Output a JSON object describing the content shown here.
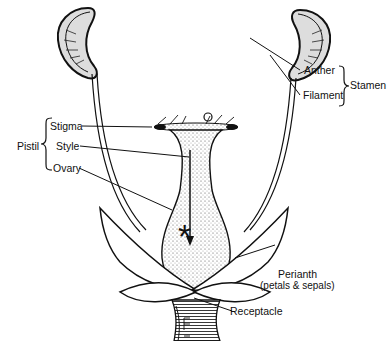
{
  "diagram": {
    "labels": {
      "anther": "Anther",
      "filament": "Filament",
      "stamen": "Stamen",
      "stigma": "Stigma",
      "style": "Style",
      "ovary": "Ovary",
      "pistil": "Pistil",
      "perianth": "Perianth",
      "perianth_sub": "(petals & sepals)",
      "receptacle": "Receptacle",
      "ovule_marker": "*"
    }
  }
}
